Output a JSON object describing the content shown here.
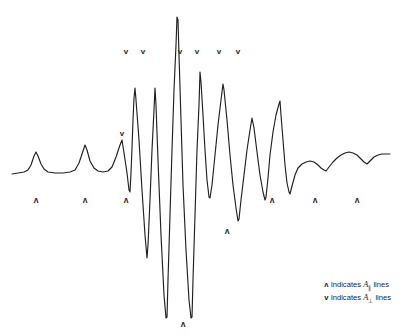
{
  "figure": {
    "title": "",
    "background_color": "#ffffff",
    "trace_color": "#231f1f"
  },
  "legend": {
    "rows": [
      {
        "glyph": "ʌ",
        "text_before": " Indicates ",
        "symbol": "A",
        "subscript": "∥",
        "text_after": " lines"
      },
      {
        "glyph": "v",
        "text_before": " Indicates ",
        "symbol": "A",
        "subscript": "⊥",
        "text_after": " lines"
      }
    ]
  },
  "markers": {
    "parallel_glyph": "ʌ",
    "perpendicular_glyph": "v",
    "parallel": [
      {
        "x": 36,
        "y": 203
      },
      {
        "x": 85,
        "y": 203
      },
      {
        "x": 126,
        "y": 203
      },
      {
        "x": 183,
        "y": 327
      },
      {
        "x": 227,
        "y": 234
      },
      {
        "x": 272,
        "y": 203
      },
      {
        "x": 315,
        "y": 203
      },
      {
        "x": 357,
        "y": 203
      }
    ],
    "perpendicular": [
      {
        "x": 122,
        "y": 136
      },
      {
        "x": 126,
        "y": 54
      },
      {
        "x": 143,
        "y": 54
      },
      {
        "x": 180,
        "y": 54
      },
      {
        "x": 197,
        "y": 54
      },
      {
        "x": 219,
        "y": 54
      },
      {
        "x": 238,
        "y": 54
      }
    ]
  },
  "chart_data": {
    "type": "line",
    "title": "",
    "xlabel": "",
    "ylabel": "",
    "grid": false,
    "legend_position": "bottom-right",
    "xlim": [
      10,
      392
    ],
    "ylim": [
      336,
      0
    ],
    "baseline_y": 172,
    "series": [
      {
        "name": "ESR spectrum",
        "color": "#231f1f",
        "points": [
          [
            12,
            174
          ],
          [
            18,
            173
          ],
          [
            24,
            172
          ],
          [
            28,
            170
          ],
          [
            31,
            165
          ],
          [
            34,
            156
          ],
          [
            36,
            152
          ],
          [
            38,
            156
          ],
          [
            41,
            164
          ],
          [
            44,
            169
          ],
          [
            48,
            172
          ],
          [
            55,
            173
          ],
          [
            63,
            173
          ],
          [
            70,
            172
          ],
          [
            75,
            170
          ],
          [
            79,
            163
          ],
          [
            83,
            151
          ],
          [
            85,
            145
          ],
          [
            87,
            150
          ],
          [
            90,
            161
          ],
          [
            94,
            168
          ],
          [
            98,
            171
          ],
          [
            103,
            172
          ],
          [
            108,
            171
          ],
          [
            112,
            167
          ],
          [
            116,
            157
          ],
          [
            120,
            145
          ],
          [
            122,
            140
          ],
          [
            124,
            153
          ],
          [
            127,
            173
          ],
          [
            129,
            190
          ],
          [
            130,
            192
          ],
          [
            131,
            173
          ],
          [
            132,
            148
          ],
          [
            133,
            120
          ],
          [
            134,
            98
          ],
          [
            135,
            88
          ],
          [
            136,
            100
          ],
          [
            139,
            140
          ],
          [
            142,
            190
          ],
          [
            145,
            235
          ],
          [
            147,
            258
          ],
          [
            148,
            245
          ],
          [
            150,
            200
          ],
          [
            152,
            150
          ],
          [
            154,
            110
          ],
          [
            155,
            88
          ],
          [
            156,
            105
          ],
          [
            158,
            160
          ],
          [
            161,
            235
          ],
          [
            164,
            295
          ],
          [
            166,
            318
          ],
          [
            167,
            317
          ],
          [
            168,
            280
          ],
          [
            170,
            215
          ],
          [
            172,
            150
          ],
          [
            174,
            90
          ],
          [
            176,
            45
          ],
          [
            177,
            17
          ],
          [
            178,
            20
          ],
          [
            179,
            55
          ],
          [
            181,
            120
          ],
          [
            183,
            185
          ],
          [
            186,
            250
          ],
          [
            189,
            300
          ],
          [
            191,
            318
          ],
          [
            192,
            317
          ],
          [
            193,
            280
          ],
          [
            195,
            215
          ],
          [
            197,
            150
          ],
          [
            199,
            105
          ],
          [
            200,
            72
          ],
          [
            201,
            82
          ],
          [
            203,
            115
          ],
          [
            205,
            150
          ],
          [
            207,
            180
          ],
          [
            209,
            197
          ],
          [
            210,
            198
          ],
          [
            212,
            185
          ],
          [
            215,
            155
          ],
          [
            218,
            125
          ],
          [
            221,
            100
          ],
          [
            223,
            84
          ],
          [
            224,
            90
          ],
          [
            227,
            120
          ],
          [
            230,
            155
          ],
          [
            233,
            185
          ],
          [
            236,
            208
          ],
          [
            238,
            221
          ],
          [
            239,
            219
          ],
          [
            241,
            200
          ],
          [
            244,
            175
          ],
          [
            247,
            150
          ],
          [
            250,
            130
          ],
          [
            252,
            118
          ],
          [
            254,
            128
          ],
          [
            257,
            152
          ],
          [
            260,
            175
          ],
          [
            263,
            192
          ],
          [
            265,
            200
          ],
          [
            266,
            197
          ],
          [
            268,
            178
          ],
          [
            270,
            155
          ],
          [
            273,
            132
          ],
          [
            276,
            115
          ],
          [
            279,
            104
          ],
          [
            280,
            101
          ],
          [
            281,
            115
          ],
          [
            283,
            140
          ],
          [
            285,
            165
          ],
          [
            287,
            183
          ],
          [
            289,
            192
          ],
          [
            290,
            194
          ],
          [
            292,
            186
          ],
          [
            295,
            175
          ],
          [
            298,
            168
          ],
          [
            302,
            164
          ],
          [
            306,
            162
          ],
          [
            310,
            161
          ],
          [
            314,
            162
          ],
          [
            318,
            165
          ],
          [
            321,
            168
          ],
          [
            324,
            170
          ],
          [
            326,
            171
          ],
          [
            329,
            167
          ],
          [
            333,
            162
          ],
          [
            337,
            158
          ],
          [
            341,
            155
          ],
          [
            345,
            153
          ],
          [
            349,
            152
          ],
          [
            353,
            153
          ],
          [
            357,
            155
          ],
          [
            360,
            158
          ],
          [
            364,
            162
          ],
          [
            367,
            164
          ],
          [
            370,
            161
          ],
          [
            374,
            157
          ],
          [
            378,
            155
          ],
          [
            382,
            154
          ],
          [
            386,
            154
          ],
          [
            390,
            154
          ]
        ]
      }
    ]
  }
}
